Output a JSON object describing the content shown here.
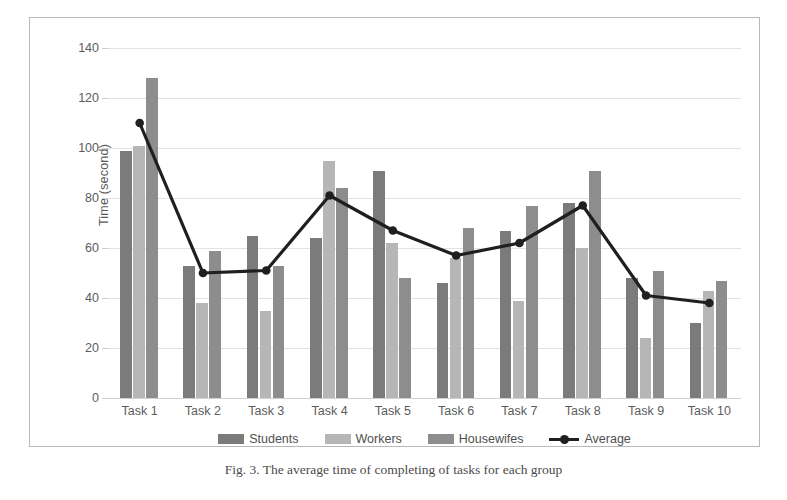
{
  "caption": {
    "figure_number": "Fig. 3.",
    "text": "The average time of completing of tasks for each group"
  },
  "chart_data": {
    "type": "bar",
    "title": "",
    "xlabel": "",
    "ylabel": "Time (second)",
    "ylim": [
      0,
      140
    ],
    "yticks": [
      0,
      20,
      40,
      60,
      80,
      100,
      120,
      140
    ],
    "grid": true,
    "legend_position": "bottom",
    "categories": [
      "Task 1",
      "Task 2",
      "Task 3",
      "Task 4",
      "Task 5",
      "Task 6",
      "Task 7",
      "Task 8",
      "Task 9",
      "Task 10"
    ],
    "series": [
      {
        "name": "Students",
        "type": "bar",
        "color": "#7b7b7b",
        "values": [
          99,
          53,
          65,
          64,
          91,
          46,
          67,
          78,
          48,
          30
        ]
      },
      {
        "name": "Workers",
        "type": "bar",
        "color": "#b6b6b6",
        "values": [
          101,
          38,
          35,
          95,
          62,
          56,
          39,
          60,
          24,
          43
        ]
      },
      {
        "name": "Housewifes",
        "type": "bar",
        "color": "#8d8d8d",
        "values": [
          128,
          59,
          53,
          84,
          48,
          68,
          77,
          91,
          51,
          47
        ]
      },
      {
        "name": "Average",
        "type": "line",
        "color": "#1f1f1f",
        "values": [
          110,
          50,
          51,
          81,
          67,
          57,
          62,
          77,
          41,
          38
        ]
      }
    ]
  },
  "colors": {
    "students": "#7b7b7b",
    "workers": "#b6b6b6",
    "housewifes": "#8d8d8d",
    "average_line": "#1f1f1f",
    "gridline": "#e2e2e2",
    "frame_border": "#b8b8b8",
    "axis_text": "#5c5c5c",
    "background": "#ffffff"
  }
}
